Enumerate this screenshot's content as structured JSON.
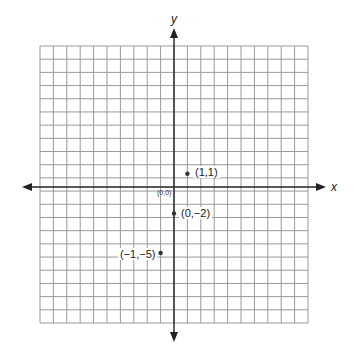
{
  "diagram": {
    "type": "coordinate-plane",
    "x_axis_label": "x",
    "y_axis_label": "y",
    "origin_label": "(0,0)",
    "grid": {
      "columns": 20,
      "rows": 21,
      "origin_col": 10,
      "origin_row": 11
    },
    "points": [
      {
        "label": "(1,1)",
        "x": 1,
        "y": 1
      },
      {
        "label": "(0,−2)",
        "x": 0,
        "y": -2
      },
      {
        "label": "(−1,−5)",
        "x": -1,
        "y": -5
      }
    ]
  }
}
